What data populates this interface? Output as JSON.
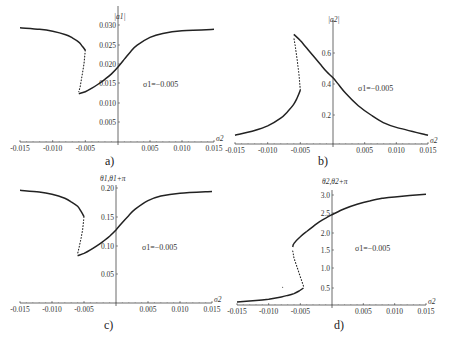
{
  "chart_data": [
    {
      "type": "line",
      "panel": "a)",
      "ylabel": "|a1|",
      "xlabel": "σ2",
      "annotation": "σ1=−0.005",
      "xlim": [
        -0.015,
        0.015
      ],
      "ylim": [
        0,
        0.03
      ],
      "xticks": [
        "-0.015",
        "-0.010",
        "-0.005",
        "0.005",
        "0.010",
        "0.015"
      ],
      "yticks": [
        "0.005",
        "0.010",
        "0.015",
        "0.020",
        "0.025",
        "0.030"
      ],
      "series": [
        {
          "name": "upper stable branch",
          "x": [
            -0.015,
            -0.012,
            -0.01,
            -0.008,
            -0.007,
            -0.006,
            -0.0055,
            -0.005
          ],
          "y": [
            0.0293,
            0.0289,
            0.0284,
            0.0275,
            0.0267,
            0.0256,
            0.0246,
            0.0235
          ]
        },
        {
          "name": "unstable branch",
          "x": [
            -0.005,
            -0.0052,
            -0.0055,
            -0.0058,
            -0.006
          ],
          "y": [
            0.0235,
            0.02,
            0.017,
            0.014,
            0.0128
          ]
        },
        {
          "name": "lower stable branch",
          "x": [
            -0.006,
            -0.005,
            -0.004,
            -0.003,
            -0.002,
            -0.001,
            0.0,
            0.001,
            0.002,
            0.003,
            0.005,
            0.007,
            0.01,
            0.015
          ],
          "y": [
            0.0123,
            0.0128,
            0.0137,
            0.0148,
            0.016,
            0.0174,
            0.0192,
            0.0212,
            0.0232,
            0.0248,
            0.0268,
            0.0278,
            0.0285,
            0.0289
          ]
        }
      ]
    },
    {
      "type": "line",
      "panel": "b)",
      "ylabel": "|a2|",
      "xlabel": "σ2",
      "annotation": "σ1=−0.005",
      "xlim": [
        -0.015,
        0.015
      ],
      "ylim": [
        0,
        0.75
      ],
      "xticks": [
        "-0.015",
        "-0.010",
        "-0.005",
        "0.005",
        "0.010",
        "0.015"
      ],
      "yticks": [
        "0.2",
        "0.4",
        "0.6"
      ],
      "series": [
        {
          "name": "lower stable branch",
          "x": [
            -0.015,
            -0.012,
            -0.01,
            -0.008,
            -0.007,
            -0.006,
            -0.0055,
            -0.005
          ],
          "y": [
            0.07,
            0.1,
            0.13,
            0.18,
            0.22,
            0.27,
            0.31,
            0.36
          ]
        },
        {
          "name": "unstable branch",
          "x": [
            -0.005,
            -0.0052,
            -0.0055,
            -0.0058,
            -0.006
          ],
          "y": [
            0.36,
            0.46,
            0.56,
            0.65,
            0.7
          ]
        },
        {
          "name": "upper stable branch",
          "x": [
            -0.006,
            -0.005,
            -0.004,
            -0.003,
            -0.002,
            -0.001,
            0.0,
            0.001,
            0.002,
            0.004,
            0.006,
            0.008,
            0.01,
            0.015
          ],
          "y": [
            0.72,
            0.68,
            0.63,
            0.58,
            0.53,
            0.48,
            0.44,
            0.39,
            0.34,
            0.26,
            0.2,
            0.15,
            0.12,
            0.07
          ]
        }
      ]
    },
    {
      "type": "line",
      "panel": "c)",
      "ylabel": "θ1,θ1+π",
      "xlabel": "σ2",
      "annotation": "σ1=−0.005",
      "xlim": [
        -0.015,
        0.015
      ],
      "ylim": [
        0,
        0.2
      ],
      "xticks": [
        "-0.015",
        "-0.010",
        "-0.005",
        "0.005",
        "0.010",
        "0.015"
      ],
      "yticks": [
        "0.05",
        "0.10",
        "0.15",
        "0.20"
      ],
      "series": [
        {
          "name": "upper stable branch",
          "x": [
            -0.015,
            -0.012,
            -0.01,
            -0.008,
            -0.007,
            -0.006,
            -0.0055,
            -0.005
          ],
          "y": [
            0.196,
            0.193,
            0.189,
            0.182,
            0.176,
            0.168,
            0.16,
            0.15
          ]
        },
        {
          "name": "unstable branch",
          "x": [
            -0.005,
            -0.0052,
            -0.0055,
            -0.0058,
            -0.006
          ],
          "y": [
            0.15,
            0.128,
            0.11,
            0.095,
            0.085
          ]
        },
        {
          "name": "lower stable branch",
          "x": [
            -0.006,
            -0.005,
            -0.004,
            -0.003,
            -0.002,
            -0.001,
            0.0,
            0.001,
            0.002,
            0.003,
            0.005,
            0.007,
            0.01,
            0.015
          ],
          "y": [
            0.082,
            0.086,
            0.092,
            0.099,
            0.107,
            0.116,
            0.127,
            0.14,
            0.152,
            0.163,
            0.178,
            0.186,
            0.191,
            0.194
          ]
        }
      ]
    },
    {
      "type": "line",
      "panel": "d)",
      "ylabel": "θ2,θ2+π",
      "xlabel": "σ2",
      "annotation": "σ1=−0.005",
      "xlim": [
        -0.015,
        0.015
      ],
      "ylim": [
        0,
        3.1
      ],
      "xticks": [
        "-0.015",
        "-0.010",
        "-0.005",
        "0.005",
        "0.010",
        "0.015"
      ],
      "yticks": [
        "0.5",
        "1.0",
        "1.5",
        "2.0",
        "2.5",
        "3.0"
      ],
      "series": [
        {
          "name": "lower stable branch",
          "x": [
            -0.015,
            -0.012,
            -0.01,
            -0.008,
            -0.007,
            -0.006,
            -0.0052,
            -0.0045
          ],
          "y": [
            0.12,
            0.16,
            0.2,
            0.26,
            0.3,
            0.35,
            0.42,
            0.5
          ]
        },
        {
          "name": "unstable branch",
          "x": [
            -0.0045,
            -0.005,
            -0.0055,
            -0.006,
            -0.0062
          ],
          "y": [
            0.55,
            0.8,
            1.05,
            1.3,
            1.5
          ]
        },
        {
          "name": "upper stable branch",
          "x": [
            -0.0062,
            -0.006,
            -0.005,
            -0.004,
            -0.003,
            -0.002,
            -0.001,
            0.0,
            0.002,
            0.004,
            0.006,
            0.008,
            0.01,
            0.015
          ],
          "y": [
            1.6,
            1.7,
            1.88,
            2.02,
            2.15,
            2.28,
            2.38,
            2.47,
            2.63,
            2.75,
            2.84,
            2.91,
            2.95,
            3.02
          ]
        },
        {
          "name": "isolated point",
          "x": [
            -0.0078
          ],
          "y": [
            0.52
          ]
        }
      ]
    }
  ],
  "labels": {
    "a": "a)",
    "b": "b)",
    "c": "c)",
    "d": "d)"
  }
}
